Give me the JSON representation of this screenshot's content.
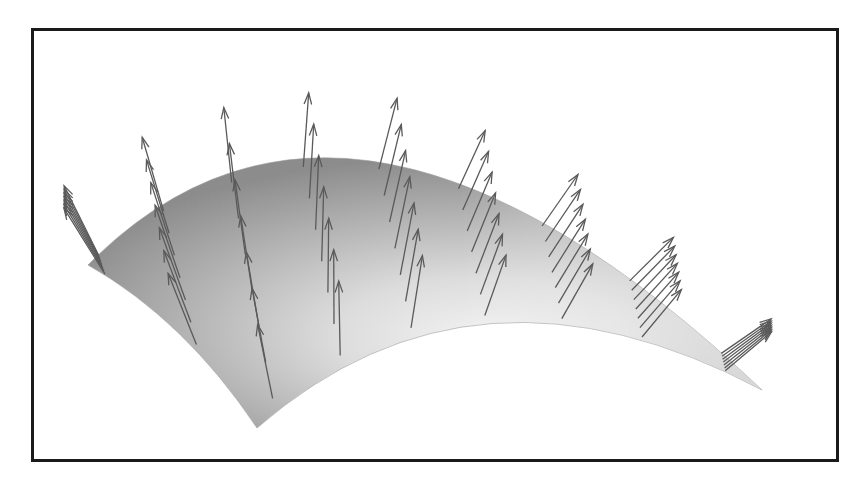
{
  "figure": {
    "title": "Curved surface patch with unit normal vectors",
    "description": "3D rendered parametric surface shaded in gray with a grid of normal-vector arrows drawn from sample points",
    "surface": {
      "shading_dark": "#8c8c8c",
      "shading_light": "#f4f4f4",
      "edge_color": "#9a9a9a"
    },
    "vector_field": {
      "type": "surface-normals",
      "grid_u": 9,
      "grid_v": 7,
      "arrow_color": "#5a5a5a",
      "arrow_icon": "arrow-icon"
    },
    "frame_color": "#1a1a1a"
  }
}
